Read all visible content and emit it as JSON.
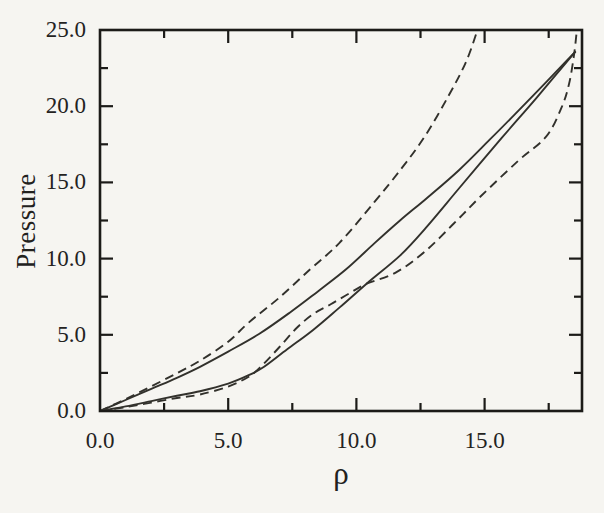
{
  "figure": {
    "background": "#f6f5f1",
    "ink": "#32312c",
    "axis_ink": "#1c1b18"
  },
  "chart_data": {
    "type": "line",
    "title": "",
    "xlabel": "ρ",
    "ylabel": "Pressure",
    "xlim": [
      0,
      18.8
    ],
    "ylim": [
      0,
      25
    ],
    "grid": false,
    "legend": null,
    "x_major_ticks": [
      0,
      5,
      10,
      15
    ],
    "x_tick_labels": [
      "0.0",
      "5.0",
      "10.0",
      "15.0"
    ],
    "x_minor_ticks": [
      2.5,
      7.5,
      12.5,
      17.5
    ],
    "y_major_ticks": [
      0,
      5,
      10,
      15,
      20,
      25
    ],
    "y_tick_labels": [
      "0.0",
      "5.0",
      "10.0",
      "15.0",
      "20.0",
      "25.0"
    ],
    "y_minor_ticks": [
      2.5,
      7.5,
      12.5,
      17.5,
      22.5
    ],
    "series": [
      {
        "name": "upper-solid-isotherm",
        "line_style": "solid",
        "marker": "none",
        "points": [
          [
            0,
            0
          ],
          [
            1,
            0.72
          ],
          [
            2,
            1.45
          ],
          [
            3,
            2.18
          ],
          [
            3.9,
            2.9
          ],
          [
            5,
            3.9
          ],
          [
            6.2,
            5.05
          ],
          [
            7.4,
            6.45
          ],
          [
            8.5,
            7.85
          ],
          [
            9.6,
            9.3
          ],
          [
            10.7,
            11.0
          ],
          [
            11.7,
            12.5
          ],
          [
            12.7,
            13.9
          ],
          [
            14,
            15.8
          ],
          [
            15.2,
            17.8
          ],
          [
            16.2,
            19.5
          ],
          [
            17.3,
            21.4
          ],
          [
            18.55,
            23.6
          ]
        ]
      },
      {
        "name": "upper-dashed-isotherm",
        "line_style": "dashed",
        "marker": "none",
        "points": [
          [
            0,
            0
          ],
          [
            1,
            0.78
          ],
          [
            2,
            1.62
          ],
          [
            3,
            2.48
          ],
          [
            3.9,
            3.3
          ],
          [
            5,
            4.55
          ],
          [
            5.8,
            5.8
          ],
          [
            7,
            7.45
          ],
          [
            8.2,
            9.3
          ],
          [
            9.35,
            11.05
          ],
          [
            10.7,
            13.7
          ],
          [
            11.8,
            16.0
          ],
          [
            12.7,
            18.1
          ],
          [
            13.6,
            20.7
          ],
          [
            14.3,
            23.0
          ],
          [
            14.8,
            25.4
          ]
        ]
      },
      {
        "name": "lower-solid-isotherm",
        "line_style": "solid",
        "marker": "none",
        "points": [
          [
            0,
            0
          ],
          [
            1,
            0.3
          ],
          [
            2,
            0.65
          ],
          [
            3,
            1.0
          ],
          [
            3.9,
            1.3
          ],
          [
            5,
            1.8
          ],
          [
            5.8,
            2.35
          ],
          [
            6.4,
            2.9
          ],
          [
            7.3,
            4.05
          ],
          [
            8.3,
            5.3
          ],
          [
            9.35,
            6.8
          ],
          [
            10.4,
            8.35
          ],
          [
            11.7,
            10.2
          ],
          [
            12.7,
            12.0
          ],
          [
            14,
            14.6
          ],
          [
            15.66,
            17.9
          ],
          [
            17,
            20.5
          ],
          [
            18.55,
            23.6
          ]
        ]
      },
      {
        "name": "lower-dashed-isotherm",
        "line_style": "dashed",
        "marker": "none",
        "points": [
          [
            0,
            0
          ],
          [
            1,
            0.25
          ],
          [
            2,
            0.55
          ],
          [
            3,
            0.85
          ],
          [
            3.9,
            1.08
          ],
          [
            5,
            1.6
          ],
          [
            5.8,
            2.25
          ],
          [
            6.3,
            2.95
          ],
          [
            7,
            4.2
          ],
          [
            7.7,
            5.5
          ],
          [
            8.35,
            6.4
          ],
          [
            9,
            7.0
          ],
          [
            9.7,
            7.7
          ],
          [
            10.4,
            8.35
          ],
          [
            11.55,
            9.1
          ],
          [
            12.7,
            10.5
          ],
          [
            13.8,
            12.3
          ],
          [
            14.8,
            14.0
          ],
          [
            16.3,
            16.4
          ],
          [
            17.4,
            18.0
          ],
          [
            18,
            19.9
          ],
          [
            18.3,
            21.5
          ],
          [
            18.5,
            23.5
          ],
          [
            18.62,
            25.4
          ]
        ]
      }
    ]
  }
}
